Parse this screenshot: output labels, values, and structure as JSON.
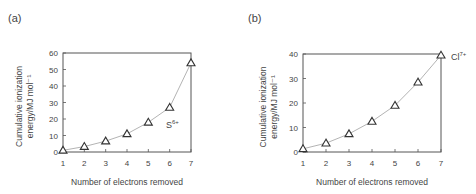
{
  "panels": [
    {
      "label": "(a)",
      "ion": {
        "base": "S",
        "charge": "6+"
      }
    },
    {
      "label": "(b)",
      "ion": {
        "base": "Cl",
        "charge": "7+"
      }
    }
  ],
  "chart_data": [
    {
      "type": "line",
      "title": "(a)",
      "xlabel": "Number of electrons removed",
      "ylabel": "Cumulative ionization energy/MJ mol⁻¹",
      "annotation": "S6+",
      "x": [
        1,
        2,
        3,
        4,
        5,
        6,
        7
      ],
      "series": [
        {
          "name": "S",
          "marker": "triangle",
          "values": [
            1.0,
            3.3,
            6.6,
            11.0,
            18.0,
            27.0,
            54.0
          ]
        }
      ],
      "xlim": [
        1,
        7
      ],
      "ylim": [
        0,
        60
      ],
      "xticks": [
        "1",
        "2",
        "3",
        "4",
        "5",
        "6",
        "7"
      ],
      "yticks": [
        "0",
        "10",
        "20",
        "30",
        "40",
        "50",
        "60"
      ],
      "grid": false
    },
    {
      "type": "line",
      "title": "(b)",
      "xlabel": "Number of electrons removed",
      "ylabel": "Cumulative ionization energy/MJ mol⁻¹",
      "annotation": "Cl7+",
      "x": [
        1,
        2,
        3,
        4,
        5,
        6,
        7
      ],
      "series": [
        {
          "name": "Cl",
          "marker": "triangle",
          "values": [
            1.3,
            3.6,
            7.4,
            12.5,
            19.0,
            28.5,
            39.5
          ]
        }
      ],
      "xlim": [
        1,
        7
      ],
      "ylim": [
        0,
        40
      ],
      "xticks": [
        "1",
        "2",
        "3",
        "4",
        "5",
        "6",
        "7"
      ],
      "yticks": [
        "0",
        "10",
        "20",
        "30",
        "40"
      ],
      "grid": false
    }
  ],
  "axis": {
    "xlabel": "Number of electrons removed",
    "ylabel_line1": "Cumulative ionization",
    "ylabel_line2": "energy/MJ mol⁻¹"
  },
  "colors": {
    "line": "#aaaaaa",
    "marker": "#333333",
    "axis": "#555555",
    "text": "#444444"
  }
}
